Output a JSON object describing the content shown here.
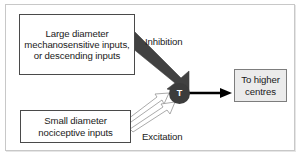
{
  "diagram": {
    "type": "neural-gate-control-schematic",
    "boxes": [
      {
        "id": "large-inputs",
        "lines": [
          "Large diameter",
          "mechanosensitive",
          "inputs, or",
          "descending inputs"
        ],
        "text": "Large diameter mechanosensitive inputs, or descending inputs",
        "fill": "#ffffff",
        "border": "#4a4a4a"
      },
      {
        "id": "small-inputs",
        "lines": [
          "Small diameter",
          "nociceptive inputs"
        ],
        "text": "Small diameter nociceptive inputs",
        "fill": "#ffffff",
        "border": "#4a4a4a"
      },
      {
        "id": "higher-centres",
        "lines": [
          "To higher",
          "centres"
        ],
        "text": "To higher centres",
        "fill": "#ebebeb",
        "border": "#7d7d7d"
      }
    ],
    "node": {
      "id": "t-cell",
      "label": "T",
      "fill": "#3c3c3c",
      "text_color": "#ffffff"
    },
    "pathway_labels": {
      "inhibition": "Inhibition",
      "excitation": "Excitation"
    },
    "arrows": [
      {
        "id": "inhibition-arrow",
        "from": "large-inputs",
        "to": "t-cell",
        "label": "Inhibition",
        "style": "thick-tapered-filled",
        "color": "#414141"
      },
      {
        "id": "excitation-arrow-upper",
        "from": "small-inputs",
        "to": "t-cell",
        "label": "Excitation",
        "style": "thin-outlined-hollow",
        "color": "#8c8c8c"
      },
      {
        "id": "excitation-arrow-lower",
        "from": "small-inputs",
        "to": "t-cell",
        "label": "Excitation",
        "style": "thin-outlined-hollow",
        "color": "#8c8c8c"
      },
      {
        "id": "output-arrow",
        "from": "t-cell",
        "to": "higher-centres",
        "label": "",
        "style": "solid-line",
        "color": "#000000"
      }
    ],
    "frame": {
      "background": "#ffffff",
      "border": "#c8c8c8"
    }
  }
}
